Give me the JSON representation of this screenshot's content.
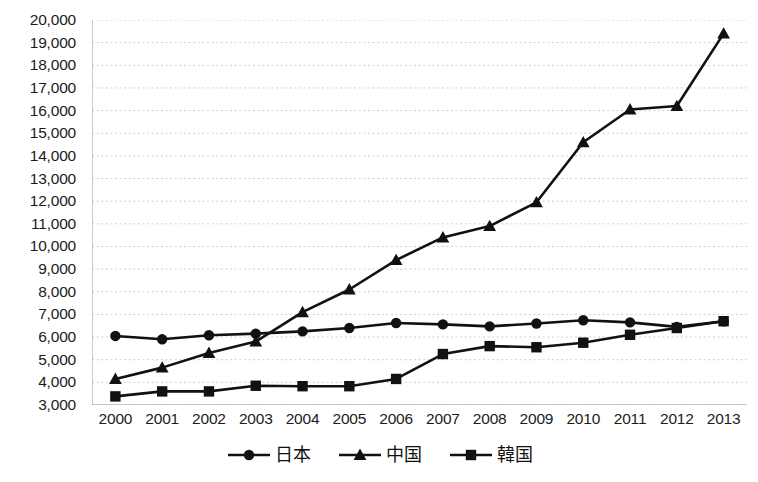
{
  "chart_data": {
    "type": "line",
    "title": "",
    "subtitle": "",
    "xlabel": "",
    "ylabel": "",
    "categories": [
      "2000",
      "2001",
      "2002",
      "2003",
      "2004",
      "2005",
      "2006",
      "2007",
      "2008",
      "2009",
      "2010",
      "2011",
      "2012",
      "2013"
    ],
    "ylim": [
      3000,
      20000
    ],
    "ytick_step": 1000,
    "yticks": [
      20000,
      19000,
      18000,
      17000,
      16000,
      15000,
      14000,
      13000,
      12000,
      11000,
      10000,
      9000,
      8000,
      7000,
      6000,
      5000,
      4000,
      3000
    ],
    "ytick_labels": [
      "20,000",
      "19,000",
      "18,000",
      "17,000",
      "16,000",
      "15,000",
      "14,000",
      "13,000",
      "12,000",
      "11,000",
      "10,000",
      "9,000",
      "8,000",
      "7,000",
      "6,000",
      "5,000",
      "4,000",
      "3,000"
    ],
    "grid": true,
    "grid_style": "dotted",
    "grid_color": "#cfcfcf",
    "legend_position": "bottom",
    "series": [
      {
        "name": "日本",
        "marker": "circle",
        "color": "#111111",
        "values": [
          6050,
          5900,
          6080,
          6150,
          6250,
          6400,
          6620,
          6560,
          6470,
          6600,
          6740,
          6650,
          6450,
          6700
        ]
      },
      {
        "name": "中国",
        "marker": "triangle",
        "color": "#111111",
        "values": [
          4150,
          4650,
          5300,
          5800,
          7100,
          8100,
          9400,
          10400,
          10900,
          11950,
          14600,
          16050,
          16200,
          19400
        ]
      },
      {
        "name": "韓国",
        "marker": "square",
        "color": "#111111",
        "values": [
          3380,
          3600,
          3600,
          3850,
          3830,
          3830,
          4150,
          5250,
          5600,
          5550,
          5750,
          6100,
          6400,
          6700
        ]
      }
    ]
  },
  "legend": {
    "entries": [
      {
        "label": "日本",
        "marker": "circle-marker-icon"
      },
      {
        "label": "中国",
        "marker": "triangle-marker-icon"
      },
      {
        "label": "韓国",
        "marker": "square-marker-icon"
      }
    ]
  },
  "footer": {
    "note": ""
  }
}
